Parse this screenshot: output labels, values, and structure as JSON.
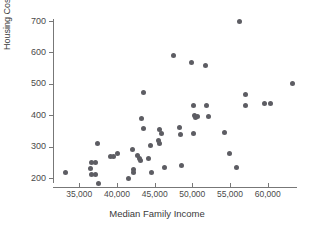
{
  "chart_data": {
    "type": "scatter",
    "title": "",
    "xlabel": "Median Family Income",
    "ylabel": "Housing Cost Index",
    "xlim": [
      32000,
      64500
    ],
    "ylim": [
      170,
      715
    ],
    "grid": false,
    "legend": null,
    "xticks": [
      35000,
      40000,
      45000,
      50000,
      55000,
      60000
    ],
    "xtick_labels": [
      "35,000",
      "40,000",
      "45,000",
      "50,000",
      "55,000",
      "60,000"
    ],
    "yticks": [
      200,
      300,
      400,
      500,
      600,
      700
    ],
    "ytick_labels": [
      "200",
      "300",
      "400",
      "500",
      "600",
      "700"
    ],
    "marker_color": "#5d5d63",
    "axis_color": "#777777",
    "points": [
      {
        "x": 33200,
        "y": 216
      },
      {
        "x": 36600,
        "y": 248
      },
      {
        "x": 36500,
        "y": 231
      },
      {
        "x": 36600,
        "y": 212
      },
      {
        "x": 37400,
        "y": 310
      },
      {
        "x": 37100,
        "y": 250
      },
      {
        "x": 37200,
        "y": 210
      },
      {
        "x": 37600,
        "y": 184
      },
      {
        "x": 39100,
        "y": 269
      },
      {
        "x": 39500,
        "y": 268
      },
      {
        "x": 40100,
        "y": 277
      },
      {
        "x": 41500,
        "y": 199
      },
      {
        "x": 42100,
        "y": 290
      },
      {
        "x": 42200,
        "y": 228
      },
      {
        "x": 42200,
        "y": 218
      },
      {
        "x": 42700,
        "y": 271
      },
      {
        "x": 43000,
        "y": 261
      },
      {
        "x": 43100,
        "y": 255
      },
      {
        "x": 43200,
        "y": 391
      },
      {
        "x": 43500,
        "y": 358
      },
      {
        "x": 44200,
        "y": 263
      },
      {
        "x": 43500,
        "y": 472
      },
      {
        "x": 44500,
        "y": 305
      },
      {
        "x": 44600,
        "y": 216
      },
      {
        "x": 45500,
        "y": 318
      },
      {
        "x": 45600,
        "y": 309
      },
      {
        "x": 45700,
        "y": 356
      },
      {
        "x": 45900,
        "y": 341
      },
      {
        "x": 46300,
        "y": 232
      },
      {
        "x": 47500,
        "y": 590
      },
      {
        "x": 48300,
        "y": 362
      },
      {
        "x": 48400,
        "y": 339
      },
      {
        "x": 48600,
        "y": 241
      },
      {
        "x": 49900,
        "y": 568
      },
      {
        "x": 50100,
        "y": 432
      },
      {
        "x": 50300,
        "y": 400
      },
      {
        "x": 50400,
        "y": 392
      },
      {
        "x": 50700,
        "y": 396
      },
      {
        "x": 50200,
        "y": 342
      },
      {
        "x": 51800,
        "y": 557
      },
      {
        "x": 51900,
        "y": 431
      },
      {
        "x": 52100,
        "y": 396
      },
      {
        "x": 54300,
        "y": 346
      },
      {
        "x": 54900,
        "y": 279
      },
      {
        "x": 55800,
        "y": 234
      },
      {
        "x": 56200,
        "y": 700
      },
      {
        "x": 57000,
        "y": 467
      },
      {
        "x": 57100,
        "y": 431
      },
      {
        "x": 59600,
        "y": 438
      },
      {
        "x": 60400,
        "y": 438
      },
      {
        "x": 63300,
        "y": 501
      }
    ]
  }
}
